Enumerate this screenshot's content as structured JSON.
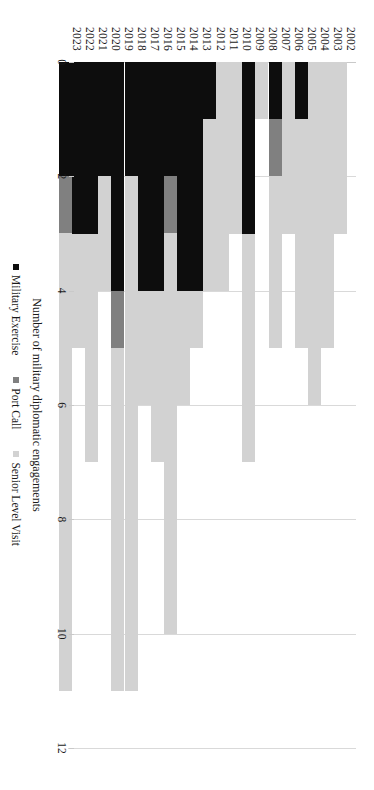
{
  "chart_data": {
    "type": "bar",
    "orientation": "horizontal-stacked",
    "title": "",
    "xlabel": "",
    "ylabel": "Number of military diplomatic engagements",
    "ylim": [
      0,
      12
    ],
    "ytick_step": 2,
    "ytick_labels": [
      "0",
      "2",
      "4",
      "6",
      "8",
      "10",
      "12"
    ],
    "grid": true,
    "legend_position": "bottom",
    "categories": [
      "2002",
      "2003",
      "2004",
      "2005",
      "2006",
      "2007",
      "2008",
      "2009",
      "2010",
      "2011",
      "2012",
      "2013",
      "2014",
      "2015",
      "2016",
      "2017",
      "2018",
      "2019",
      "2020",
      "2021",
      "2022",
      "2023"
    ],
    "series": [
      {
        "name": "Military Exercise",
        "color": "#0d0d0d",
        "values": [
          0,
          0,
          0,
          1,
          0,
          1,
          0,
          3,
          0,
          0,
          1,
          4,
          4,
          2,
          4,
          4,
          2,
          4,
          2,
          3,
          3,
          2
        ]
      },
      {
        "name": "Port Call",
        "color": "#808080",
        "values": [
          0,
          0,
          0,
          0,
          0,
          1,
          0,
          0,
          0,
          0,
          0,
          0,
          0,
          1,
          0,
          0,
          0,
          1,
          0,
          0,
          0,
          1
        ]
      },
      {
        "name": "Senior Level Visit",
        "color": "#d2d2d2",
        "values": [
          3,
          5,
          6,
          4,
          3,
          3,
          1,
          4,
          3,
          4,
          3,
          1,
          2,
          7,
          3,
          2,
          9,
          6,
          2,
          4,
          2,
          8
        ]
      }
    ],
    "totals": [
      3,
      5,
      6,
      5,
      3,
      5,
      1,
      7,
      3,
      4,
      4,
      5,
      6,
      10,
      7,
      6,
      11,
      11,
      4,
      7,
      5,
      11
    ]
  },
  "legend": {
    "items": [
      {
        "label": "Military Exercise",
        "key": "mil"
      },
      {
        "label": "Port Call",
        "key": "port"
      },
      {
        "label": "Senior Level Visit",
        "key": "slv"
      }
    ]
  },
  "axis": {
    "value_title": "Number of military diplomatic engagements"
  }
}
